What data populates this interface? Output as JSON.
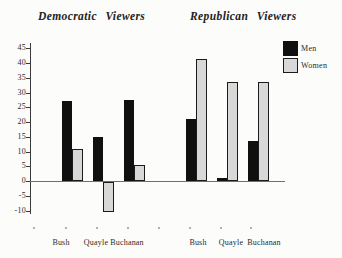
{
  "figure": {
    "description_colors": {
      "men_bar": "#101010",
      "women_bar": "#d8d8d8",
      "axis": "#3a3a3a",
      "background": "#fcfcfb"
    }
  },
  "legend": {
    "position": "top-right",
    "items": [
      {
        "label": "Men",
        "color": "#101010"
      },
      {
        "label": "Women",
        "color": "#d8d8d8"
      }
    ]
  },
  "chart_data": {
    "type": "bar",
    "panels": [
      {
        "title": "Democratic Viewers",
        "categories": [
          "Bush",
          "Quayle",
          "Buchanan"
        ],
        "series": [
          {
            "name": "Men",
            "values": [
              27,
              15,
              27.5
            ]
          },
          {
            "name": "Women",
            "values": [
              11,
              -10,
              5.5
            ]
          }
        ]
      },
      {
        "title": "Republican Viewers",
        "categories": [
          "Bush",
          "Quayle",
          "Buchanan"
        ],
        "series": [
          {
            "name": "Men",
            "values": [
              21,
              1,
              13.5
            ]
          },
          {
            "name": "Women",
            "values": [
              41.5,
              33.5,
              33.5
            ]
          }
        ]
      }
    ],
    "xlabel": "",
    "ylabel": "",
    "ylim": [
      -10,
      45
    ],
    "yticks": [
      45,
      40,
      35,
      30,
      25,
      20,
      15,
      10,
      5,
      0,
      -5,
      -10
    ],
    "grid": false,
    "legend_position": "top-right",
    "series_colors": {
      "Men": "#101010",
      "Women": "#d8d8d8"
    }
  }
}
